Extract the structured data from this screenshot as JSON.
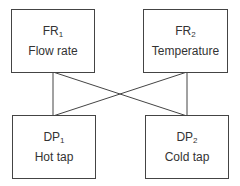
{
  "diagram": {
    "nodes": [
      {
        "id": "fr1",
        "code": "FR",
        "sub": "1",
        "label": "Flow rate"
      },
      {
        "id": "fr2",
        "code": "FR",
        "sub": "2",
        "label": "Temperature"
      },
      {
        "id": "dp1",
        "code": "DP",
        "sub": "1",
        "label": "Hot tap"
      },
      {
        "id": "dp2",
        "code": "DP",
        "sub": "2",
        "label": "Cold tap"
      }
    ],
    "edges": [
      {
        "from": "fr1",
        "to": "dp1"
      },
      {
        "from": "fr1",
        "to": "dp2"
      },
      {
        "from": "fr2",
        "to": "dp1"
      },
      {
        "from": "fr2",
        "to": "dp2"
      }
    ]
  }
}
